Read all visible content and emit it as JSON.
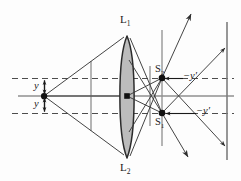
{
  "figure": {
    "type": "optics-ray-diagram",
    "title": "",
    "background_color": "#fdfdfd",
    "labels": {
      "lens_top": "L",
      "lens_top_sub": "1",
      "lens_bottom": "L",
      "lens_bottom_sub": "2",
      "image_point_upper": "S",
      "image_point_upper_sub": "2",
      "image_point_lower": "S",
      "image_point_lower_sub": "1",
      "object_height_upper": "y",
      "object_height_lower": "y",
      "image_height_upper": "−y′",
      "image_height_lower": "−y′"
    },
    "colors": {
      "ray": "#3a3a3a",
      "axis": "#8c8c8c",
      "dashed": "#555555",
      "lens_fill": "#b9b9b9",
      "lens_stroke": "#2b2b2b",
      "stop_line": "#8c8c8c",
      "point": "#111111",
      "screen": "#7a7a7a"
    },
    "geometry": {
      "object_point": [
        44,
        96
      ],
      "lens_center": [
        127,
        96
      ],
      "lens_top_vertex": [
        127,
        36
      ],
      "lens_bottom_vertex": [
        127,
        158
      ],
      "image_point_upper": [
        162,
        78
      ],
      "image_point_lower": [
        162,
        113
      ],
      "axis_y": 96,
      "dashed_upper_y": 78,
      "dashed_lower_y": 113,
      "screen_x": 227,
      "stop_x": 91,
      "detector_x": 150,
      "plane_x": 162
    }
  }
}
